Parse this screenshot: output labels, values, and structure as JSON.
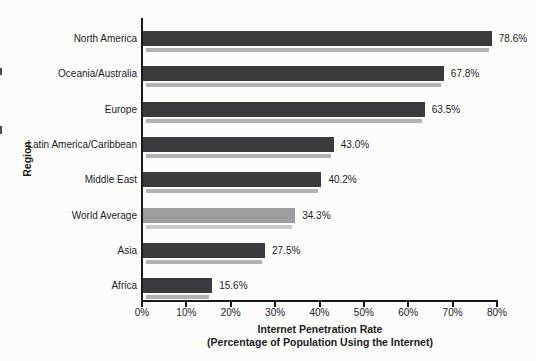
{
  "page": {
    "background_color": "#fcfcfb"
  },
  "chart_data": {
    "type": "bar",
    "orientation": "horizontal",
    "title": "",
    "xlabel": "Internet Penetration Rate",
    "xlabel_sub": "(Percentage of Population Using the Internet)",
    "ylabel": "Region",
    "categories": [
      "North America",
      "Oceania/Australia",
      "Europe",
      "Latin America/Caribbean",
      "Middle East",
      "World Average",
      "Asia",
      "Africa"
    ],
    "values": [
      78.6,
      67.8,
      63.5,
      43.0,
      40.2,
      34.3,
      27.5,
      15.6
    ],
    "value_labels": [
      "78.6%",
      "67.8%",
      "63.5%",
      "43.0%",
      "40.2%",
      "34.3%",
      "27.5%",
      "15.6%"
    ],
    "xlim": [
      0,
      80
    ],
    "x_ticks": [
      "0%",
      "10%",
      "20%",
      "30%",
      "40%",
      "50%",
      "60%",
      "70%",
      "80%"
    ],
    "grid": false,
    "legend": false,
    "highlighted_category": "World Average",
    "colors": {
      "bar": "#3b3b3d",
      "bar_shadow": "#b2b2b2",
      "highlight_bar": "#9e9e9e",
      "highlight_bar_shadow": "#c9c9c9",
      "axis": "#1a1a1a",
      "text": "#1c1c1c"
    }
  }
}
